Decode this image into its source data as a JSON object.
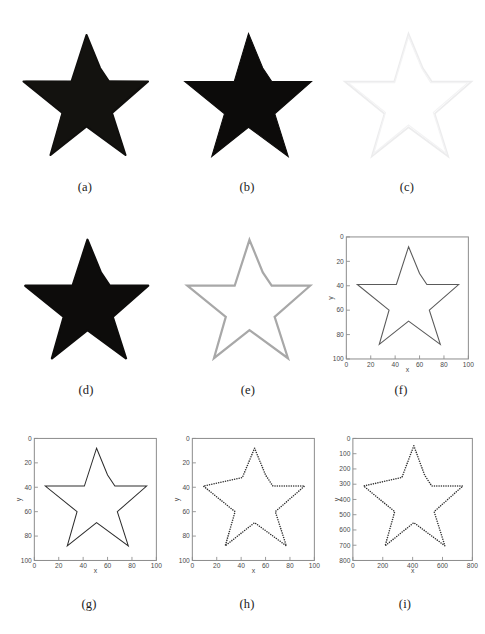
{
  "figure": {
    "layout": {
      "rows": 3,
      "cols": 3,
      "width": 485,
      "height": 634
    },
    "background_color": "#ffffff"
  },
  "panels": [
    {
      "id": "a",
      "caption": "(a)",
      "kind": "image",
      "render": "filled-star",
      "description": "Original binary star image, solid black filled star on white background, noisy/jagged edges",
      "fill_color": "#100f0d",
      "background_color": "#fefefe"
    },
    {
      "id": "b",
      "caption": "(b)",
      "kind": "image",
      "render": "filled-star",
      "description": "Smoothed black filled star on white background",
      "fill_color": "#0c0b0a",
      "background_color": "#ffffff"
    },
    {
      "id": "c",
      "caption": "(c)",
      "kind": "image",
      "render": "outline-star",
      "description": "Very faint star outline, near-white edge map on white background",
      "stroke_color": "#ececed",
      "background_color": "#ffffff"
    },
    {
      "id": "d",
      "caption": "(d)",
      "kind": "image",
      "render": "filled-star",
      "description": "Black filled star, morphological result",
      "fill_color": "#0d0c0b",
      "background_color": "#ffffff"
    },
    {
      "id": "e",
      "caption": "(e)",
      "kind": "image",
      "render": "outline-star",
      "description": "Gray star boundary outline on white background",
      "stroke_color": "#a8a8a8",
      "background_color": "#ffffff"
    },
    {
      "id": "f",
      "caption": "(f)",
      "kind": "plot",
      "description": "Boundary contour plotted in axes, y-axis reversed (image coordinates)"
    },
    {
      "id": "g",
      "caption": "(g)",
      "kind": "plot",
      "description": "Smoothed boundary contour, thin dark line, y-axis reversed"
    },
    {
      "id": "h",
      "caption": "(h)",
      "kind": "plot",
      "description": "Sampled boundary points shown as discrete dot markers, y-axis reversed"
    },
    {
      "id": "i",
      "caption": "(i)",
      "kind": "plot",
      "description": "Re-scaled sampled boundary points on 0-800 axes, y-axis reversed"
    }
  ],
  "chart_data": [
    {
      "panel": "f",
      "type": "line",
      "title": "",
      "xlabel": "x",
      "ylabel": "y",
      "xlim": [
        0,
        100
      ],
      "ylim": [
        100,
        0
      ],
      "y_axis_inverted": true,
      "xticks": [
        0,
        20,
        40,
        60,
        80,
        100
      ],
      "yticks": [
        0,
        20,
        40,
        60,
        80,
        100
      ],
      "grid": false,
      "legend": null,
      "series": [
        {
          "name": "boundary",
          "style": "solid-line",
          "color": "#5a5a5a",
          "x": [
            51,
            57,
            60,
            66,
            74,
            83,
            92,
            82,
            75,
            68,
            66,
            71,
            75,
            74,
            66,
            59,
            51,
            43,
            35,
            27,
            26,
            30,
            34,
            35,
            33,
            25,
            17,
            9,
            18,
            27,
            35,
            41,
            43,
            46,
            48,
            51
          ],
          "y": [
            8,
            22,
            30,
            35,
            39,
            39,
            39,
            46,
            51,
            57,
            60,
            72,
            87,
            79,
            73,
            69,
            68,
            73,
            79,
            87,
            83,
            73,
            62,
            60,
            52,
            44,
            39,
            39,
            39,
            39,
            39,
            32,
            24,
            18,
            12,
            8
          ]
        }
      ]
    },
    {
      "panel": "g",
      "type": "line",
      "title": "",
      "xlabel": "x",
      "ylabel": "y",
      "xlim": [
        0,
        100
      ],
      "ylim": [
        100,
        0
      ],
      "y_axis_inverted": true,
      "xticks": [
        0,
        20,
        40,
        60,
        80,
        100
      ],
      "yticks": [
        0,
        20,
        40,
        60,
        80,
        100
      ],
      "grid": false,
      "legend": null,
      "series": [
        {
          "name": "smoothed-boundary",
          "style": "solid-line",
          "color": "#2c2c2c",
          "x": [
            51,
            60,
            66,
            92,
            68,
            77,
            51,
            27,
            35,
            9,
            41,
            51
          ],
          "y": [
            8,
            30,
            39,
            39,
            60,
            88,
            69,
            88,
            60,
            39,
            32,
            8
          ]
        }
      ]
    },
    {
      "panel": "h",
      "type": "scatter",
      "title": "",
      "xlabel": "x",
      "ylabel": "y",
      "xlim": [
        0,
        100
      ],
      "ylim": [
        100,
        0
      ],
      "y_axis_inverted": true,
      "xticks": [
        0,
        20,
        40,
        60,
        80,
        100
      ],
      "yticks": [
        0,
        20,
        40,
        60,
        80,
        100
      ],
      "grid": false,
      "legend": null,
      "marker": "dot",
      "marker_color": "#2f2f2f",
      "series": [
        {
          "name": "sampled-boundary-points",
          "x": [
            51,
            60,
            66,
            92,
            68,
            77,
            51,
            27,
            35,
            9,
            41,
            51
          ],
          "y": [
            8,
            30,
            39,
            39,
            60,
            88,
            69,
            88,
            60,
            39,
            32,
            8
          ],
          "sample_count": 160
        }
      ]
    },
    {
      "panel": "i",
      "type": "scatter",
      "title": "",
      "xlabel": "x",
      "ylabel": "y",
      "xlim": [
        0,
        800
      ],
      "ylim": [
        800,
        0
      ],
      "y_axis_inverted": true,
      "xticks": [
        0,
        200,
        400,
        600,
        800
      ],
      "yticks": [
        0,
        100,
        200,
        300,
        400,
        500,
        600,
        700,
        800
      ],
      "grid": false,
      "legend": null,
      "marker": "dot",
      "marker_color": "#2f2f2f",
      "series": [
        {
          "name": "rescaled-boundary-points",
          "x": [
            408,
            480,
            528,
            736,
            544,
            616,
            408,
            216,
            280,
            72,
            328,
            408
          ],
          "y": [
            48,
            240,
            312,
            312,
            480,
            704,
            552,
            704,
            480,
            312,
            256,
            48
          ],
          "sample_count": 160
        }
      ]
    }
  ],
  "star_geometry": {
    "description": "5-pointed star polygon in normalized 0-100 image coordinates, y increases downward",
    "points": [
      [
        51,
        8
      ],
      [
        60,
        30
      ],
      [
        66,
        39
      ],
      [
        92,
        39
      ],
      [
        68,
        60
      ],
      [
        77,
        88
      ],
      [
        51,
        69
      ],
      [
        27,
        88
      ],
      [
        35,
        60
      ],
      [
        9,
        39
      ],
      [
        41,
        39
      ],
      [
        51,
        8
      ]
    ],
    "outer_radius": 44,
    "inner_radius": 18,
    "center": [
      51,
      48
    ]
  }
}
